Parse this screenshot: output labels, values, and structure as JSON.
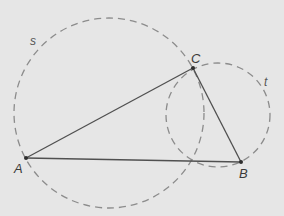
{
  "diagram": {
    "type": "geometry-construction",
    "circles": [
      {
        "id": "s",
        "label": "s",
        "style": "dashed"
      },
      {
        "id": "t",
        "label": "t",
        "style": "dashed"
      }
    ],
    "points": [
      {
        "id": "A",
        "label": "A"
      },
      {
        "id": "B",
        "label": "B"
      },
      {
        "id": "C",
        "label": "C"
      }
    ],
    "segments": [
      {
        "id": "AB",
        "from": "A",
        "to": "B"
      },
      {
        "id": "AC",
        "from": "A",
        "to": "C"
      },
      {
        "id": "BC",
        "from": "B",
        "to": "C"
      }
    ],
    "colors": {
      "background": "#e6e6e6",
      "segment": "#505050",
      "circle": "#8c8c8c",
      "label": "#3a3a3a"
    }
  }
}
